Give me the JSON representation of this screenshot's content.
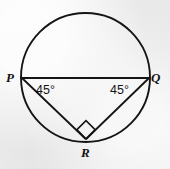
{
  "figure": {
    "type": "geometry-diagram",
    "stroke_color": "#151515",
    "background_color": "#ececec",
    "circle": {
      "center_x": 85.5,
      "center_y": 77.5,
      "radius": 64.5,
      "stroke_width": 1.9
    },
    "vertices": [
      {
        "name": "P",
        "label": "P",
        "x": 21.5,
        "y": 78.0,
        "label_x": 6,
        "label_y": 71
      },
      {
        "name": "Q",
        "label": "Q",
        "x": 149.5,
        "y": 78.0,
        "label_x": 151,
        "label_y": 71
      },
      {
        "name": "R",
        "label": "R",
        "x": 86.0,
        "y": 139.0,
        "label_x": 81,
        "label_y": 146
      }
    ],
    "segments": [
      {
        "name": "chord-PQ",
        "from": "P",
        "to": "Q",
        "stroke_width": 2.0
      },
      {
        "name": "side-PR",
        "from": "P",
        "to": "R",
        "stroke_width": 1.8
      },
      {
        "name": "side-QR",
        "from": "Q",
        "to": "R",
        "stroke_width": 1.8
      }
    ],
    "angle_marks": [
      {
        "name": "angle-at-P",
        "vertex": "P",
        "label": "45°",
        "label_x": 36,
        "label_y": 84
      },
      {
        "name": "angle-at-Q",
        "vertex": "Q",
        "label": "45°",
        "label_x": 110,
        "label_y": 84
      }
    ],
    "right_angle_mark": {
      "name": "right-angle-at-R",
      "vertex": "R",
      "shape": "square",
      "rotation_deg": 45,
      "size": 13,
      "stroke_width": 1.7
    }
  }
}
